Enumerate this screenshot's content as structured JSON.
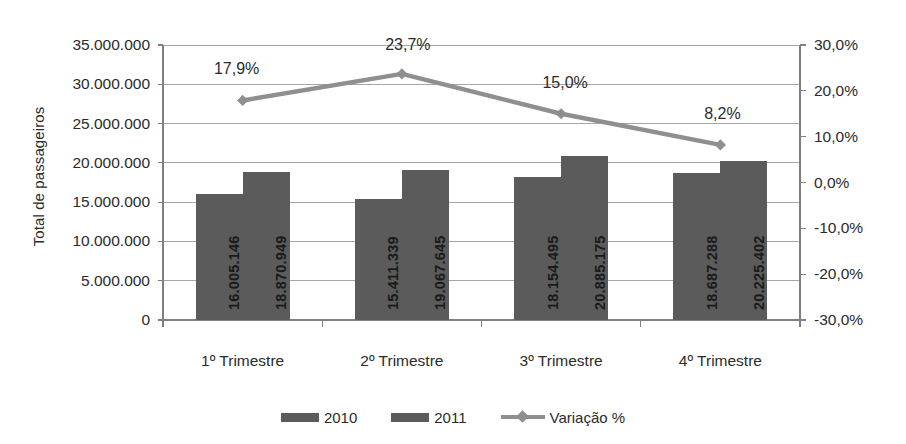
{
  "chart_data": {
    "type": "bar",
    "title": "",
    "subtitle": "",
    "xlabel": "",
    "ylabel": "Total de passageiros",
    "y2label": "",
    "categories": [
      "1º Trimestre",
      "2º Trimestre",
      "3º Trimestre",
      "4º Trimestre"
    ],
    "ylim": [
      0,
      35000000
    ],
    "y_ticks": [
      0,
      5000000,
      10000000,
      15000000,
      20000000,
      25000000,
      30000000,
      35000000
    ],
    "y_tick_labels": [
      "0",
      "5.000.000",
      "10.000.000",
      "15.000.000",
      "20.000.000",
      "25.000.000",
      "30.000.000",
      "35.000.000"
    ],
    "y2lim": [
      -30,
      30
    ],
    "y2_ticks": [
      -30,
      -20,
      -10,
      0,
      10,
      20,
      30
    ],
    "y2_tick_labels": [
      "-30,0%",
      "-20,0%",
      "-10,0%",
      "0,0%",
      "10,0%",
      "20,0%",
      "30,0%"
    ],
    "grid": true,
    "legend_position": "bottom",
    "series": [
      {
        "name": "2010",
        "type": "bar",
        "axis": "left",
        "color": "#5b5b5b",
        "values": [
          16005146,
          19067645,
          18154495,
          18687288
        ],
        "labels": [
          "16.005.146",
          "15.411.339",
          "18.154.495",
          "18.687.288"
        ],
        "values_corrected": [
          16005146,
          15411339,
          18154495,
          18687288
        ]
      },
      {
        "name": "2011",
        "type": "bar",
        "axis": "left",
        "color": "#5b5b5b",
        "values": [
          18870949,
          19067645,
          20885175,
          20225402
        ],
        "labels": [
          "18.870.949",
          "19.067.645",
          "20.885.175",
          "20.225.402"
        ]
      },
      {
        "name": "Variação %",
        "type": "line",
        "axis": "right",
        "color": "#8f8f8f",
        "marker": "diamond",
        "values": [
          17.9,
          23.7,
          15.0,
          8.2
        ],
        "labels": [
          "17,9%",
          "23,7%",
          "15,0%",
          "8,2%"
        ]
      }
    ]
  },
  "legend": {
    "items": [
      {
        "label": "2010",
        "swatch": "bar",
        "color": "#5b5b5b"
      },
      {
        "label": "2011",
        "swatch": "bar",
        "color": "#5b5b5b"
      },
      {
        "label": "Variação %",
        "swatch": "line",
        "color": "#8f8f8f"
      }
    ]
  },
  "colors": {
    "bar": "#5b5b5b",
    "line": "#8f8f8f",
    "grid": "#a6a6a6",
    "axis": "#808080",
    "text": "#2b2b2b"
  }
}
